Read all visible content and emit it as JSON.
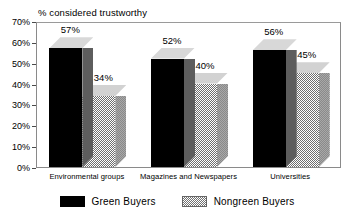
{
  "chart_data": {
    "type": "bar",
    "title": "% considered trustworthy",
    "xlabel": "",
    "ylabel": "",
    "ylim": [
      0,
      70
    ],
    "ytick_step": 10,
    "ytick_labels": [
      "0%",
      "10%",
      "20%",
      "30%",
      "40%",
      "50%",
      "60%",
      "70%"
    ],
    "ytick_values": [
      0,
      10,
      20,
      30,
      40,
      50,
      60,
      70
    ],
    "grid": false,
    "legend_position": "bottom",
    "style": "3d-bar",
    "categories": [
      "Environmental groups",
      "Magazines and Newspapers",
      "Universities"
    ],
    "series": [
      {
        "name": "Green  Buyers",
        "color": "#000000",
        "values": [
          57,
          52,
          56
        ],
        "value_labels": [
          "57%",
          "52%",
          "56%"
        ]
      },
      {
        "name": "Nongreen  Buyers",
        "color": "#7a7a7a",
        "values": [
          34,
          40,
          45
        ],
        "value_labels": [
          "34%",
          "40%",
          "45%"
        ]
      }
    ]
  },
  "legend": {
    "entries": [
      {
        "label": "Green  Buyers",
        "swatch": "green-swatch"
      },
      {
        "label": "Nongreen  Buyers",
        "swatch": "nongreen-swatch"
      }
    ]
  },
  "colors": {
    "series_green_front": "#000000",
    "series_green_top": "#d8d8d8",
    "series_green_side": "#5d5d5d",
    "series_nongreen_front": "#7a7a7a",
    "series_nongreen_top": "#d2d2d2",
    "series_nongreen_side": "#a8a8a8",
    "axis": "#8a8a8a",
    "text": "#000000",
    "background": "#ffffff"
  }
}
